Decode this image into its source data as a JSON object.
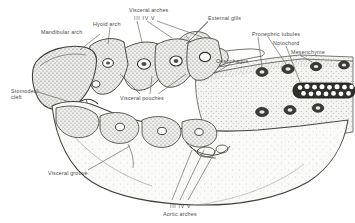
{
  "figure": {
    "background_color": "#ffffff",
    "ink_color": "#3b3b3b",
    "label_color": "#4a4a4a",
    "tissue_fill": "#f2f2f0",
    "stipple_color": "#7b7b78",
    "width": 355,
    "height": 223
  },
  "labels": [
    {
      "id": "mandibular-arch",
      "text": "Mandibular arch",
      "x": 41,
      "y": 29,
      "align": "left"
    },
    {
      "id": "hyoid-arch",
      "text": "Hyoid arch",
      "x": 93,
      "y": 21,
      "align": "left"
    },
    {
      "id": "visceral-arches",
      "text": "Visceral arches",
      "x": 129,
      "y": 7,
      "align": "left"
    },
    {
      "id": "visceral-arch-numerals",
      "text": "III IV  V",
      "x": 134,
      "y": 15,
      "align": "left"
    },
    {
      "id": "external-gills",
      "text": "External gills",
      "x": 208,
      "y": 15,
      "align": "left"
    },
    {
      "id": "oesophagus",
      "text": "Oesophagus",
      "x": 216,
      "y": 58,
      "align": "left"
    },
    {
      "id": "pronephric-tubules",
      "text": "Pronephric tubules",
      "x": 252,
      "y": 31,
      "align": "left"
    },
    {
      "id": "notochord",
      "text": "Notochord",
      "x": 273,
      "y": 40,
      "align": "left"
    },
    {
      "id": "mesenchyme",
      "text": "Mesenchyme",
      "x": 291,
      "y": 49,
      "align": "left"
    },
    {
      "id": "stomodeal-cleft-1",
      "text": "Stomodeal",
      "x": 11,
      "y": 88,
      "align": "left"
    },
    {
      "id": "stomodeal-cleft-2",
      "text": "cleft",
      "x": 11,
      "y": 94,
      "align": "left"
    },
    {
      "id": "visceral-pouches",
      "text": "Visceral pouches",
      "x": 120,
      "y": 95,
      "align": "left"
    },
    {
      "id": "visceral-groove",
      "text": "Visceral groove",
      "x": 48,
      "y": 170,
      "align": "left"
    },
    {
      "id": "aortic-arch-numerals",
      "text": "III IV V",
      "x": 170,
      "y": 203,
      "align": "left"
    },
    {
      "id": "aortic-arches",
      "text": "Aortic arches",
      "x": 163,
      "y": 211,
      "align": "left"
    }
  ],
  "structures": [
    {
      "id": "mandibular-arch-block",
      "kind": "arch",
      "note": "large anterior block, dense stipple"
    },
    {
      "id": "hyoid-arch-block",
      "kind": "arch",
      "note": "second arch with central lumen"
    },
    {
      "id": "visceral-arch-III",
      "kind": "arch",
      "note": "bar with aortic arch lumen"
    },
    {
      "id": "visceral-arch-IV",
      "kind": "arch",
      "note": "bar with aortic arch lumen"
    },
    {
      "id": "visceral-arch-V",
      "kind": "arch",
      "note": "bar with aortic arch lumen"
    },
    {
      "id": "external-gill-filaments",
      "kind": "gills",
      "note": "lobed projections dorsal-right"
    },
    {
      "id": "oesophagus-lumen",
      "kind": "cavity",
      "note": "pale open lumen"
    },
    {
      "id": "notochord-rod",
      "kind": "rod",
      "note": "dark-outlined vacuolated cell rod, right edge"
    },
    {
      "id": "pronephric-tubule-sections",
      "kind": "tubules",
      "note": "dark oval profiles"
    },
    {
      "id": "mesenchyme-field",
      "kind": "tissue",
      "note": "loose stippled tissue"
    },
    {
      "id": "lower-jaw-body",
      "kind": "tissue",
      "note": "pale stippled ventral mass"
    },
    {
      "id": "visceral-groove-cleft",
      "kind": "groove",
      "note": "surface indentation"
    }
  ]
}
